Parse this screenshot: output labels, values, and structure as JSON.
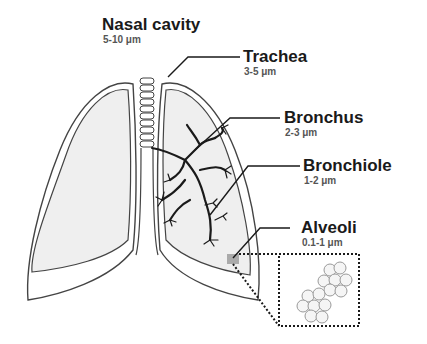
{
  "labels": [
    {
      "id": "nasal-cavity",
      "name": "Nasal cavity",
      "size": "5-10 μm"
    },
    {
      "id": "trachea",
      "name": "Trachea",
      "size": "3-5 μm"
    },
    {
      "id": "bronchus",
      "name": "Bronchus",
      "size": "2-3 μm"
    },
    {
      "id": "bronchiole",
      "name": "Bronchiole",
      "size": "1-2 μm"
    },
    {
      "id": "alveoli",
      "name": "Alveoli",
      "size": "0.1-1 μm"
    }
  ],
  "colors": {
    "outline": "#444444",
    "lung_fill": "#efefef",
    "airway": "#1a1a1a",
    "alveoli_marker": "#aaaaaa",
    "text_main": "#1a1a1a",
    "text_sub": "#555555"
  }
}
